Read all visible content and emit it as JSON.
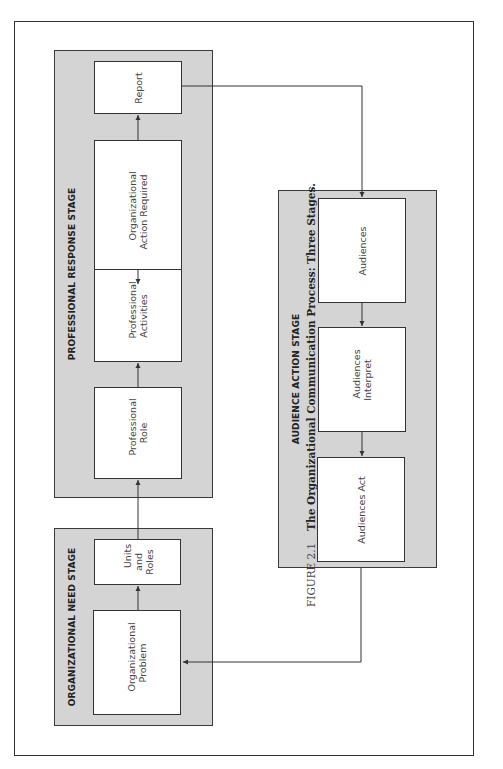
{
  "caption": {
    "figure_number": "FIGURE 2.1",
    "title": "The Organizational Communication Process: Three Stages."
  },
  "stages": {
    "organizational_need": {
      "label": "ORGANIZATIONAL NEED STAGE",
      "boxes": [
        {
          "id": "organizational-problem",
          "label": "Organizational\nProblem"
        },
        {
          "id": "units-and-roles",
          "label": "Units\nand\nRoles"
        }
      ]
    },
    "professional_response": {
      "label": "PROFESSIONAL RESPONSE STAGE",
      "boxes": [
        {
          "id": "professional-role",
          "label": "Professional\nRole"
        },
        {
          "id": "professional-activities",
          "label": "Professional\nActivities"
        },
        {
          "id": "organizational-action-required",
          "label": "Organizational\nAction Required"
        },
        {
          "id": "report",
          "label": "Report"
        }
      ]
    },
    "audience_action": {
      "label": "AUDIENCE ACTION STAGE",
      "boxes": [
        {
          "id": "audiences",
          "label": "Audiences"
        },
        {
          "id": "audiences-interpret",
          "label": "Audiences\nInterpret"
        },
        {
          "id": "audiences-act",
          "label": "Audiences Act"
        }
      ]
    }
  },
  "flow": [
    "Organizational Problem -> Units and Roles",
    "Units and Roles -> Professional Role",
    "Professional Role -> Professional Activities",
    "Professional Activities -> Organizational Action Required",
    "Organizational Action Required -> Report",
    "Report -> Audiences",
    "Audiences -> Audiences Interpret",
    "Audiences Interpret -> Audiences Act",
    "Audiences Act -> Organizational Problem"
  ],
  "colors": {
    "stage_fill": "#d4d4d4",
    "box_fill": "#ffffff",
    "line": "#333333"
  }
}
